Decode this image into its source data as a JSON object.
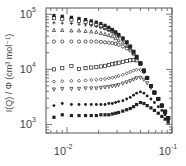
{
  "chart_data": {
    "type": "scatter",
    "title": "",
    "xlabel": "",
    "ylabel": "I(Q) / Φ (cm³ mol⁻¹)",
    "xscale": "log",
    "yscale": "log",
    "xlim": [
      0.0063,
      0.1
    ],
    "ylim": [
      700,
      130000
    ],
    "x_ticks": [
      {
        "value": 0.01,
        "label": "10",
        "exp": "-2"
      },
      {
        "value": 0.1,
        "label": "10",
        "exp": "-1"
      }
    ],
    "y_ticks": [
      {
        "value": 1000,
        "label": "10",
        "exp": "3"
      },
      {
        "value": 10000,
        "label": "10",
        "exp": "4"
      },
      {
        "value": 100000,
        "label": "10",
        "exp": "5"
      }
    ],
    "grid": false,
    "legend": null,
    "x": [
      0.0075,
      0.009,
      0.011,
      0.013,
      0.015,
      0.017,
      0.019,
      0.021,
      0.023,
      0.025,
      0.027,
      0.029,
      0.031,
      0.034,
      0.037,
      0.04,
      0.043,
      0.046,
      0.05,
      0.054,
      0.058,
      0.063,
      0.068,
      0.074,
      0.08,
      0.086,
      0.092
    ],
    "series": [
      {
        "name": "s1",
        "marker": "filled-square",
        "values": [
          95000,
          92000,
          88000,
          84000,
          80000,
          76000,
          72000,
          68000,
          63000,
          58000,
          53000,
          48000,
          43000,
          37000,
          31000,
          26000,
          21000,
          17000,
          13000,
          9500,
          7000,
          5000,
          3800,
          2900,
          2200,
          1700,
          1300
        ]
      },
      {
        "name": "s2",
        "marker": "open-square",
        "values": [
          85000,
          83000,
          80000,
          76000,
          73000,
          69000,
          65000,
          61000,
          57000,
          53000,
          49000,
          45000,
          41000,
          36000,
          31000,
          26000,
          21000,
          17000,
          13000,
          9500,
          7000,
          5000,
          3800,
          2900,
          2200,
          1700,
          1300
        ]
      },
      {
        "name": "s3",
        "marker": "plus",
        "values": [
          70000,
          69000,
          68000,
          66000,
          64000,
          62000,
          60000,
          57000,
          54000,
          51000,
          48000,
          44000,
          40000,
          35000,
          30000,
          26000,
          21000,
          17000,
          13000,
          9500,
          7000,
          5000,
          3800,
          2900,
          2200,
          1700,
          1300
        ]
      },
      {
        "name": "s4",
        "marker": "open-triangle-up",
        "values": [
          52000,
          52000,
          51000,
          51000,
          50000,
          49000,
          48000,
          46000,
          44000,
          42000,
          40000,
          37000,
          34000,
          31000,
          27000,
          24000,
          20000,
          16500,
          13000,
          9500,
          7000,
          5000,
          3800,
          2900,
          2200,
          1700,
          1300
        ]
      },
      {
        "name": "s5",
        "marker": "open-circle",
        "values": [
          32000,
          32000,
          32000,
          32000,
          32000,
          32000,
          32000,
          31500,
          31000,
          30500,
          30000,
          29000,
          28000,
          26000,
          24000,
          22000,
          19000,
          16000,
          12500,
          9500,
          7000,
          5000,
          3800,
          2900,
          2200,
          1700,
          1300
        ]
      },
      {
        "name": "s6",
        "marker": "open-square-2",
        "values": [
          10000,
          10500,
          11500,
          10200,
          10500,
          10800,
          11000,
          11300,
          11600,
          12000,
          12400,
          12800,
          13200,
          13700,
          14200,
          14600,
          14800,
          14600,
          12500,
          9500,
          7000,
          5000,
          3800,
          2900,
          2200,
          1700,
          1300
        ]
      },
      {
        "name": "s7",
        "marker": "open-diamond",
        "values": [
          6000,
          6100,
          6200,
          6200,
          6300,
          6400,
          6500,
          6600,
          6700,
          6900,
          7100,
          7300,
          7600,
          8000,
          8500,
          9000,
          9500,
          9900,
          9800,
          8800,
          7000,
          5000,
          3800,
          2900,
          2200,
          1700,
          1300
        ]
      },
      {
        "name": "s8",
        "marker": "open-triangle-down",
        "values": [
          4300,
          4400,
          4400,
          4400,
          4500,
          4500,
          4500,
          4600,
          4700,
          4800,
          4900,
          5000,
          5200,
          5500,
          5800,
          6100,
          6500,
          6900,
          7000,
          6500,
          5600,
          4600,
          3700,
          2900,
          2200,
          1700,
          1300
        ]
      },
      {
        "name": "s9",
        "marker": "filled-circle",
        "values": [
          2200,
          2400,
          2300,
          2300,
          2300,
          2300,
          2300,
          2300,
          2300,
          2400,
          2400,
          2500,
          2600,
          2700,
          2900,
          3100,
          3400,
          3700,
          3900,
          3700,
          3300,
          2900,
          2500,
          2100,
          1800,
          1500,
          1200
        ]
      },
      {
        "name": "s10",
        "marker": "filled-square-small",
        "values": [
          1350,
          1500,
          1450,
          1450,
          1450,
          1450,
          1450,
          1500,
          1500,
          1500,
          1550,
          1600,
          1650,
          1750,
          1850,
          1950,
          2100,
          2300,
          2500,
          2400,
          2200,
          2000,
          1800,
          1600,
          1400,
          1250,
          1100
        ]
      }
    ]
  }
}
